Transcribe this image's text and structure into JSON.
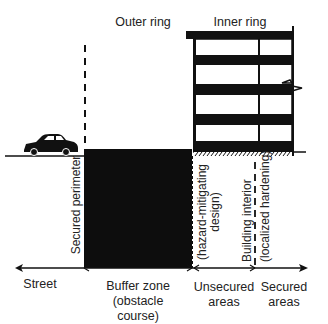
{
  "diagram": {
    "header": {
      "outer_ring": "Outer ring",
      "inner_ring": "Inner ring"
    },
    "vertical_labels": {
      "secured_perimeter": "Secured perimeter",
      "hazard_line1": "(hazard-mitigating",
      "hazard_line2": "design)",
      "building_line1": "Building interior",
      "building_line2": "(localized hardening)"
    },
    "bottom_labels": {
      "street": "Street",
      "buffer_line1": "Buffer zone",
      "buffer_line2": "(obstacle course)",
      "unsecured_line1": "Unsecured",
      "unsecured_line2": "areas",
      "secured_line1": "Secured",
      "secured_line2": "areas"
    },
    "icons": [
      "car-icon",
      "building-icon",
      "flag-icon"
    ],
    "colors": {
      "ink": "#111111",
      "background": "#ffffff"
    }
  }
}
